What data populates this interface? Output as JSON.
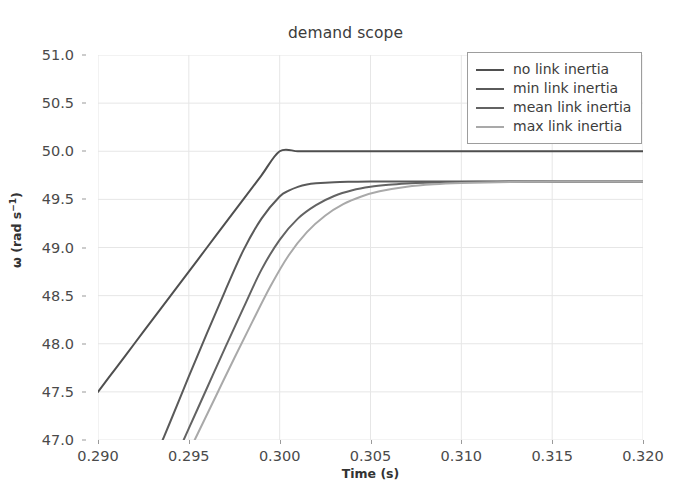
{
  "chart_data": {
    "type": "line",
    "title": "demand scope",
    "xlabel": "Time (s)",
    "ylabel": "ω (rad s⁻¹)",
    "ylabel_base": "ω (rad s",
    "ylabel_exp": "−1",
    "ylabel_tail": ")",
    "xlim": [
      0.29,
      0.32
    ],
    "ylim": [
      47.0,
      51.0
    ],
    "grid": true,
    "legend_position": "upper right",
    "xticks": [
      0.29,
      0.295,
      0.3,
      0.305,
      0.31,
      0.315,
      0.32
    ],
    "xtick_labels": [
      "0.290",
      "0.295",
      "0.300",
      "0.305",
      "0.310",
      "0.315",
      "0.320"
    ],
    "yticks": [
      47.0,
      47.5,
      48.0,
      48.5,
      49.0,
      49.5,
      50.0,
      50.5,
      51.0
    ],
    "ytick_labels": [
      "47.0",
      "47.5",
      "48.0",
      "48.5",
      "49.0",
      "49.5",
      "50.0",
      "50.5",
      "51.0"
    ],
    "series": [
      {
        "name": "no link inertia",
        "color": "#4f4f4f",
        "width": 2.0,
        "x": [
          0.29,
          0.291,
          0.292,
          0.293,
          0.294,
          0.295,
          0.296,
          0.297,
          0.298,
          0.299,
          0.3,
          0.301,
          0.302,
          0.304,
          0.306,
          0.308,
          0.31,
          0.312,
          0.314,
          0.316,
          0.318,
          0.32
        ],
        "y": [
          47.5,
          47.75,
          48.0,
          48.25,
          48.5,
          48.75,
          49.0,
          49.25,
          49.5,
          49.75,
          50.0,
          50.0,
          50.0,
          50.0,
          50.0,
          50.0,
          50.0,
          50.0,
          50.0,
          50.0,
          50.0,
          50.0
        ]
      },
      {
        "name": "min link inertia",
        "color": "#5a5a5a",
        "width": 2.0,
        "x": [
          0.293,
          0.294,
          0.295,
          0.296,
          0.297,
          0.298,
          0.299,
          0.3,
          0.3005,
          0.301,
          0.3015,
          0.302,
          0.303,
          0.304,
          0.305,
          0.307,
          0.309,
          0.311,
          0.314,
          0.317,
          0.32
        ],
        "y": [
          46.75,
          47.2,
          47.66,
          48.11,
          48.55,
          48.97,
          49.3,
          49.53,
          49.59,
          49.63,
          49.655,
          49.667,
          49.679,
          49.683,
          49.685,
          49.686,
          49.686,
          49.686,
          49.686,
          49.686,
          49.686
        ]
      },
      {
        "name": "mean link inertia",
        "color": "#636363",
        "width": 2.0,
        "x": [
          0.294,
          0.295,
          0.296,
          0.297,
          0.298,
          0.299,
          0.3,
          0.301,
          0.302,
          0.303,
          0.304,
          0.305,
          0.306,
          0.307,
          0.308,
          0.31,
          0.312,
          0.314,
          0.317,
          0.32
        ],
        "y": [
          46.7,
          47.12,
          47.54,
          47.96,
          48.37,
          48.77,
          49.08,
          49.3,
          49.44,
          49.535,
          49.594,
          49.63,
          49.651,
          49.664,
          49.672,
          49.68,
          49.684,
          49.685,
          49.686,
          49.686
        ]
      },
      {
        "name": "max link inertia",
        "color": "#a9a9a9",
        "width": 2.0,
        "x": [
          0.2945,
          0.2955,
          0.2965,
          0.2975,
          0.2985,
          0.2995,
          0.3005,
          0.3015,
          0.3025,
          0.3035,
          0.3045,
          0.3055,
          0.307,
          0.3085,
          0.31,
          0.312,
          0.3145,
          0.317,
          0.32
        ],
        "y": [
          46.68,
          47.07,
          47.46,
          47.85,
          48.23,
          48.6,
          48.92,
          49.16,
          49.33,
          49.45,
          49.53,
          49.584,
          49.632,
          49.657,
          49.67,
          49.679,
          49.684,
          49.685,
          49.686
        ]
      }
    ]
  },
  "style": {
    "grid_color": "#e6e6e6",
    "tick_color": "#9a9a9a",
    "text_color": "#3c3c3c",
    "background": "#ffffff",
    "legend_border": "#9d9d9d"
  }
}
